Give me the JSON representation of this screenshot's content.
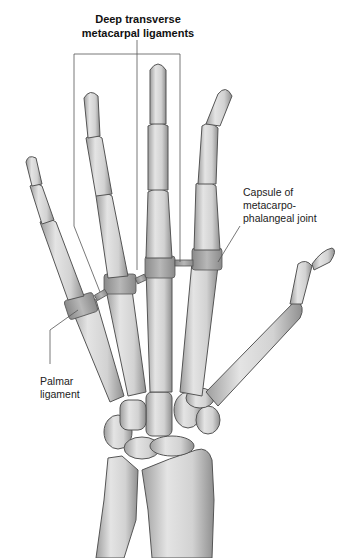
{
  "figure": {
    "title_label": "Deep transverse\nmetacarpal ligaments",
    "labels": [
      {
        "id": "capsule",
        "text": "Capsule of\nmetacarpo-\nphalangeal joint"
      },
      {
        "id": "palmar",
        "text": "Palmar\nligament"
      }
    ],
    "colors": {
      "bone_fill": "#d9d9d9",
      "bone_shade": "#a9a9a9",
      "bone_outline": "#555555",
      "ligament_fill": "#b5b5b5",
      "leader_line": "#555555",
      "background": "#ffffff"
    }
  }
}
